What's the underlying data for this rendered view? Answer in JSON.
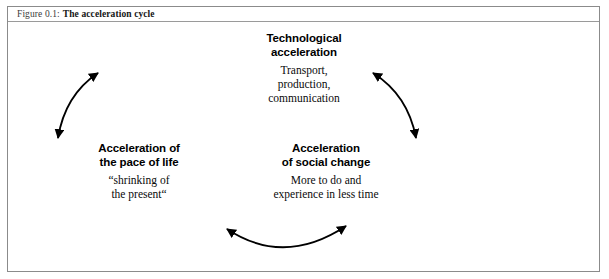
{
  "figure": {
    "caption_label": "Figure 0.1:",
    "caption_title": "The acceleration cycle"
  },
  "diagram": {
    "type": "cycle",
    "colors": {
      "stroke": "#000000",
      "frame": "#8b8b8b",
      "text": "#000000"
    },
    "nodes": [
      {
        "id": "technological-acceleration",
        "heading": "Technological\nacceleration",
        "body": "Transport,\nproduction,\ncommunication",
        "position": "top"
      },
      {
        "id": "acceleration-pace-of-life",
        "heading": "Acceleration of\nthe pace of life",
        "body": "“shrinking of\nthe present“",
        "position": "bottom-left"
      },
      {
        "id": "acceleration-social-change",
        "heading": "Acceleration\nof social change",
        "body": "More to do and\nexperience in less time",
        "position": "bottom-right"
      }
    ],
    "arrows": [
      {
        "id": "arrow-left",
        "from": "acceleration-pace-of-life",
        "to": "technological-acceleration",
        "bidirectional": true
      },
      {
        "id": "arrow-right",
        "from": "technological-acceleration",
        "to": "acceleration-social-change",
        "bidirectional": true
      },
      {
        "id": "arrow-bottom",
        "from": "acceleration-social-change",
        "to": "acceleration-pace-of-life",
        "bidirectional": true
      }
    ]
  }
}
